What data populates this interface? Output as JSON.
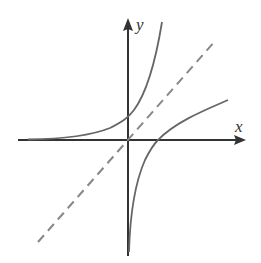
{
  "diagram": {
    "title": "",
    "axes": {
      "x_label": "x",
      "y_label": "y"
    },
    "curves": [
      {
        "name": "exponential",
        "description": "y = a^x, passes through (0,1)",
        "color": "#666666",
        "style": "solid"
      },
      {
        "name": "logarithm",
        "description": "y = log_a x, passes through (1,0)",
        "color": "#666666",
        "style": "solid"
      },
      {
        "name": "identity",
        "description": "y = x, line of symmetry",
        "color": "#888888",
        "style": "dashed"
      }
    ]
  }
}
